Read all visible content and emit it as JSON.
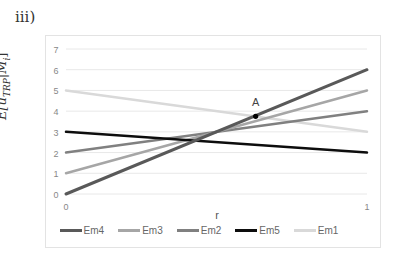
{
  "panel_label": "iii)",
  "chart_data": {
    "type": "line",
    "title": "",
    "xlabel": "r",
    "ylabel": "E[u_TRP|M_i]",
    "x": [
      0,
      1
    ],
    "xticks": [
      "0",
      "1"
    ],
    "yticks": [
      "0",
      "1",
      "2",
      "3",
      "4",
      "5",
      "6",
      "7"
    ],
    "ylim": [
      0,
      7
    ],
    "grid": true,
    "legend_position": "bottom",
    "series": [
      {
        "name": "Em4",
        "values": [
          0,
          6
        ],
        "color": "#595959",
        "width": 3
      },
      {
        "name": "Em3",
        "values": [
          1,
          5
        ],
        "color": "#a6a6a6",
        "width": 2.5
      },
      {
        "name": "Em2",
        "values": [
          2,
          4
        ],
        "color": "#808080",
        "width": 2.5
      },
      {
        "name": "Em5",
        "values": [
          3,
          2
        ],
        "color": "#0d0d0d",
        "width": 2.5
      },
      {
        "name": "Em1",
        "values": [
          5,
          3
        ],
        "color": "#d9d9d9",
        "width": 2.5
      }
    ],
    "annotations": [
      {
        "label": "A",
        "x": 0.63,
        "y": 3.75
      }
    ]
  },
  "ylabel_display": "E[u",
  "ylabel_sub": "TRP",
  "ylabel_tail": "|M",
  "ylabel_i": "i",
  "ylabel_close": "]"
}
